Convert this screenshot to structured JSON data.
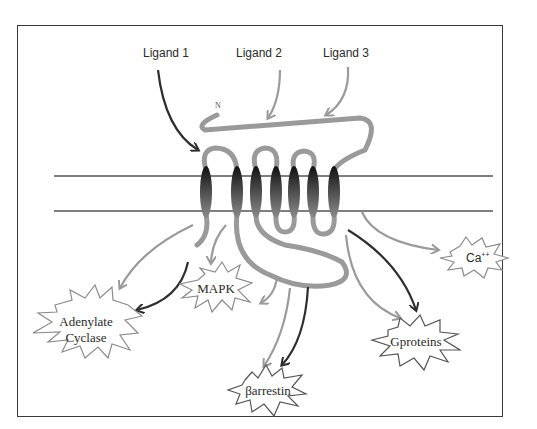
{
  "figure": {
    "ligands": [
      {
        "label": "Ligand 1",
        "arrow_color": "#2e2e2e"
      },
      {
        "label": "Ligand 2",
        "arrow_color": "#9a9a9a"
      },
      {
        "label": "Ligand 3",
        "arrow_color": "#9a9a9a"
      }
    ],
    "n_terminus_label": "N",
    "membrane": {
      "helix_count": 7,
      "helix_color": "#222222"
    },
    "effectors": [
      {
        "id": "adenylate-cyclase",
        "line1": "Adenylate",
        "line2": "Cyclase"
      },
      {
        "id": "mapk",
        "label": "MAPK"
      },
      {
        "id": "barrestin",
        "label": "βarrestin"
      },
      {
        "id": "gproteins",
        "label": "Gproteins"
      },
      {
        "id": "calcium",
        "label": "Ca",
        "superscript": "++"
      }
    ],
    "colors": {
      "frame": "#3a3a3a",
      "membrane_line": "#555555",
      "loop": "#9a9a9a",
      "arrow_light": "#9a9a9a",
      "arrow_dark": "#2e2e2e",
      "text": "#2a2a2a"
    }
  }
}
